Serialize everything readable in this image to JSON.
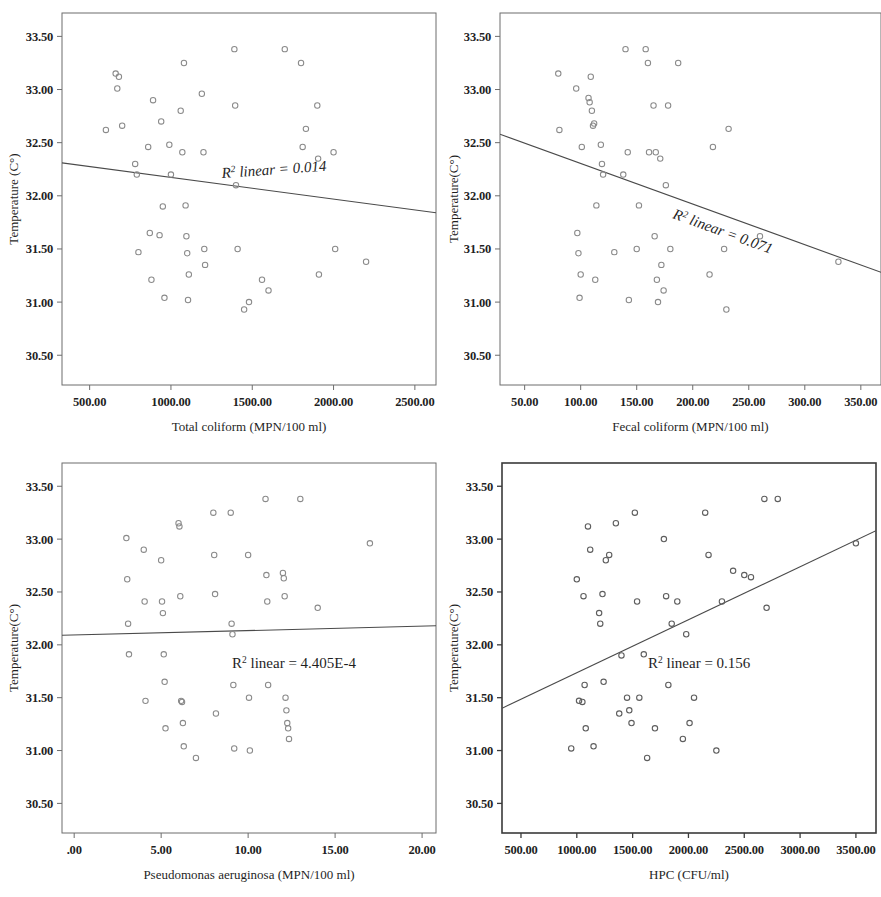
{
  "figure": {
    "panel_count": 4,
    "marker_shape": "open-circle",
    "line_color": "#4a4a4a",
    "marker_color": "#8a8a8a",
    "frame_color": "#6d6d6d"
  },
  "chart_data": [
    {
      "id": "panel-top-left",
      "type": "scatter",
      "title": "",
      "xlabel": "Total coliform (MPN/100 ml)",
      "ylabel": "Temperature (C°)",
      "annotation": "R² linear = 0.014",
      "annotation_prefix": "R",
      "annotation_sup": "2",
      "annotation_suffix": " linear = 0.014",
      "annotation_italic": true,
      "annotation_rotation": -4,
      "r_squared": 0.014,
      "xlim": [
        330,
        2630
      ],
      "ylim": [
        30.22,
        33.72
      ],
      "xticks": [
        500,
        1000,
        1500,
        2000,
        2500
      ],
      "xticklabels": [
        "500.00",
        "1000.00",
        "1500.00",
        "2000.00",
        "2500.00"
      ],
      "yticks": [
        30.5,
        31.0,
        31.5,
        32.0,
        32.5,
        33.0,
        33.5
      ],
      "yticklabels": [
        "30.50",
        "31.00",
        "31.50",
        "32.00",
        "32.50",
        "33.00",
        "33.50"
      ],
      "grid": false,
      "legend": "none",
      "fit_line": {
        "x0": 330,
        "y0": 32.31,
        "x1": 2630,
        "y1": 31.84
      },
      "points": [
        [
          600,
          32.62
        ],
        [
          660,
          33.15
        ],
        [
          680,
          33.12
        ],
        [
          670,
          33.01
        ],
        [
          700,
          32.66
        ],
        [
          780,
          32.3
        ],
        [
          790,
          32.2
        ],
        [
          800,
          31.47
        ],
        [
          860,
          32.46
        ],
        [
          870,
          31.65
        ],
        [
          880,
          31.21
        ],
        [
          890,
          32.9
        ],
        [
          930,
          31.63
        ],
        [
          940,
          32.7
        ],
        [
          950,
          31.9
        ],
        [
          960,
          31.04
        ],
        [
          990,
          32.48
        ],
        [
          1000,
          32.2
        ],
        [
          1060,
          32.8
        ],
        [
          1070,
          32.41
        ],
        [
          1080,
          33.25
        ],
        [
          1090,
          31.91
        ],
        [
          1095,
          31.62
        ],
        [
          1100,
          31.46
        ],
        [
          1105,
          31.02
        ],
        [
          1110,
          31.26
        ],
        [
          1190,
          32.96
        ],
        [
          1200,
          32.41
        ],
        [
          1205,
          31.5
        ],
        [
          1210,
          31.35
        ],
        [
          1390,
          33.38
        ],
        [
          1395,
          32.85
        ],
        [
          1400,
          32.1
        ],
        [
          1410,
          31.5
        ],
        [
          1450,
          30.93
        ],
        [
          1480,
          31.0
        ],
        [
          1560,
          31.21
        ],
        [
          1600,
          31.11
        ],
        [
          1700,
          33.38
        ],
        [
          1800,
          33.25
        ],
        [
          1810,
          32.46
        ],
        [
          1830,
          32.63
        ],
        [
          1900,
          32.85
        ],
        [
          1905,
          32.35
        ],
        [
          1910,
          31.26
        ],
        [
          2000,
          32.41
        ],
        [
          2010,
          31.5
        ],
        [
          2200,
          31.38
        ]
      ]
    },
    {
      "id": "panel-top-right",
      "type": "scatter",
      "title": "",
      "xlabel": "Fecal coliform (MPN/100 ml)",
      "ylabel": "Temperature(C°)",
      "annotation": "R² linear = 0.071",
      "annotation_prefix": "R",
      "annotation_sup": "2",
      "annotation_suffix": " linear = 0.071",
      "annotation_italic": true,
      "annotation_rotation": 20,
      "r_squared": 0.071,
      "xlim": [
        28,
        368
      ],
      "ylim": [
        30.22,
        33.72
      ],
      "xticks": [
        50,
        100,
        150,
        200,
        250,
        300,
        350
      ],
      "xticklabels": [
        "50.00",
        "100.00",
        "150.00",
        "200.00",
        "250.00",
        "300.00",
        "350.00"
      ],
      "yticks": [
        30.5,
        31.0,
        31.5,
        32.0,
        32.5,
        33.0,
        33.5
      ],
      "yticklabels": [
        "30.50",
        "31.00",
        "31.50",
        "32.00",
        "32.50",
        "33.00",
        "33.50"
      ],
      "grid": false,
      "legend": "none",
      "fit_line": {
        "x0": 28,
        "y0": 32.58,
        "x1": 368,
        "y1": 31.28
      },
      "points": [
        [
          80,
          33.15
        ],
        [
          81,
          32.62
        ],
        [
          96,
          33.01
        ],
        [
          97,
          31.65
        ],
        [
          98,
          31.46
        ],
        [
          99,
          31.04
        ],
        [
          100,
          31.26
        ],
        [
          101,
          32.46
        ],
        [
          107,
          32.92
        ],
        [
          108,
          32.88
        ],
        [
          109,
          33.12
        ],
        [
          110,
          32.8
        ],
        [
          111,
          32.66
        ],
        [
          112,
          32.68
        ],
        [
          113,
          31.21
        ],
        [
          114,
          31.91
        ],
        [
          118,
          32.48
        ],
        [
          119,
          32.3
        ],
        [
          120,
          32.2
        ],
        [
          130,
          31.47
        ],
        [
          138,
          32.2
        ],
        [
          140,
          33.38
        ],
        [
          142,
          32.41
        ],
        [
          143,
          31.02
        ],
        [
          150,
          31.5
        ],
        [
          152,
          31.91
        ],
        [
          158,
          33.38
        ],
        [
          160,
          33.25
        ],
        [
          161,
          32.41
        ],
        [
          165,
          32.85
        ],
        [
          166,
          31.62
        ],
        [
          167,
          32.41
        ],
        [
          168,
          31.21
        ],
        [
          169,
          31.0
        ],
        [
          171,
          32.35
        ],
        [
          172,
          31.35
        ],
        [
          174,
          31.11
        ],
        [
          176,
          32.1
        ],
        [
          178,
          32.85
        ],
        [
          180,
          31.5
        ],
        [
          187,
          33.25
        ],
        [
          215,
          31.26
        ],
        [
          218,
          32.46
        ],
        [
          228,
          31.5
        ],
        [
          230,
          30.93
        ],
        [
          232,
          32.63
        ],
        [
          260,
          31.62
        ],
        [
          330,
          31.38
        ]
      ]
    },
    {
      "id": "panel-bottom-left",
      "type": "scatter",
      "title": "",
      "xlabel": "Pseudomonas aeruginosa (MPN/100 ml)",
      "ylabel": "Temperature(C°)",
      "annotation": "R² linear = 4.405E-4",
      "annotation_prefix": "R",
      "annotation_sup": "2",
      "annotation_suffix": " linear = 4.405E-4",
      "annotation_italic": false,
      "annotation_rotation": 0,
      "r_squared": 0.0004405,
      "xlim": [
        -0.7,
        20.8
      ],
      "ylim": [
        30.22,
        33.72
      ],
      "xticks": [
        0,
        5,
        10,
        15,
        20
      ],
      "xticklabels": [
        ".00",
        "5.00",
        "10.00",
        "15.00",
        "20.00"
      ],
      "yticks": [
        30.5,
        31.0,
        31.5,
        32.0,
        32.5,
        33.0,
        33.5
      ],
      "yticklabels": [
        "30.50",
        "31.00",
        "31.50",
        "32.00",
        "32.50",
        "33.00",
        "33.50"
      ],
      "grid": false,
      "legend": "none",
      "fit_line": {
        "x0": -0.7,
        "y0": 32.09,
        "x1": 20.8,
        "y1": 32.18
      },
      "points": [
        [
          3,
          33.01
        ],
        [
          3.05,
          32.62
        ],
        [
          3.1,
          32.2
        ],
        [
          3.15,
          31.91
        ],
        [
          4,
          32.9
        ],
        [
          4.05,
          32.41
        ],
        [
          4.1,
          31.47
        ],
        [
          5,
          32.8
        ],
        [
          5.05,
          32.41
        ],
        [
          5.1,
          32.3
        ],
        [
          5.15,
          31.91
        ],
        [
          5.2,
          31.65
        ],
        [
          5.25,
          31.21
        ],
        [
          6,
          33.15
        ],
        [
          6.05,
          33.12
        ],
        [
          6.1,
          32.46
        ],
        [
          6.15,
          31.47
        ],
        [
          6.2,
          31.46
        ],
        [
          6.25,
          31.26
        ],
        [
          6.3,
          31.04
        ],
        [
          7,
          30.93
        ],
        [
          8,
          33.25
        ],
        [
          8.05,
          32.85
        ],
        [
          8.1,
          32.48
        ],
        [
          8.15,
          31.35
        ],
        [
          9,
          33.25
        ],
        [
          9.05,
          32.2
        ],
        [
          9.1,
          32.1
        ],
        [
          9.15,
          31.62
        ],
        [
          9.2,
          31.02
        ],
        [
          10,
          32.85
        ],
        [
          10.05,
          31.5
        ],
        [
          10.1,
          31.0
        ],
        [
          11,
          33.38
        ],
        [
          11.05,
          32.66
        ],
        [
          11.1,
          32.41
        ],
        [
          11.15,
          31.62
        ],
        [
          12,
          32.68
        ],
        [
          12.05,
          32.63
        ],
        [
          12.1,
          32.46
        ],
        [
          12.15,
          31.5
        ],
        [
          12.2,
          31.38
        ],
        [
          12.25,
          31.26
        ],
        [
          12.3,
          31.21
        ],
        [
          12.35,
          31.11
        ],
        [
          13,
          33.38
        ],
        [
          14,
          32.35
        ],
        [
          17,
          32.96
        ]
      ]
    },
    {
      "id": "panel-bottom-right",
      "type": "scatter",
      "title": "",
      "xlabel": "HPC (CFU/ml)",
      "ylabel": "Temperature(C°)",
      "annotation": "R² linear = 0.156",
      "annotation_prefix": "R",
      "annotation_sup": "2",
      "annotation_suffix": " linear = 0.156",
      "annotation_italic": false,
      "annotation_rotation": 0,
      "r_squared": 0.156,
      "xlim": [
        330,
        3680
      ],
      "ylim": [
        30.22,
        33.72
      ],
      "xticks": [
        500,
        1000,
        1500,
        2000,
        2500,
        3000,
        3500
      ],
      "xticklabels": [
        "500.00",
        "1000.00",
        "1500.00",
        "2000.00",
        "2500.00",
        "3000.00",
        "3500.00"
      ],
      "yticks": [
        30.5,
        31.0,
        31.5,
        32.0,
        32.5,
        33.0,
        33.5
      ],
      "yticklabels": [
        "30.50",
        "31.00",
        "31.50",
        "32.00",
        "32.50",
        "33.00",
        "33.50"
      ],
      "grid": false,
      "legend": "none",
      "fit_line": {
        "x0": 330,
        "y0": 31.4,
        "x1": 3680,
        "y1": 33.08
      },
      "points": [
        [
          950,
          31.02
        ],
        [
          1000,
          32.62
        ],
        [
          1020,
          31.47
        ],
        [
          1050,
          31.46
        ],
        [
          1060,
          32.46
        ],
        [
          1070,
          31.62
        ],
        [
          1080,
          31.21
        ],
        [
          1100,
          33.12
        ],
        [
          1120,
          32.9
        ],
        [
          1150,
          31.04
        ],
        [
          1200,
          32.3
        ],
        [
          1210,
          32.2
        ],
        [
          1230,
          32.48
        ],
        [
          1240,
          31.65
        ],
        [
          1260,
          32.8
        ],
        [
          1290,
          32.85
        ],
        [
          1350,
          33.15
        ],
        [
          1380,
          31.35
        ],
        [
          1400,
          31.9
        ],
        [
          1450,
          31.5
        ],
        [
          1470,
          31.38
        ],
        [
          1490,
          31.26
        ],
        [
          1520,
          33.25
        ],
        [
          1540,
          32.41
        ],
        [
          1560,
          31.5
        ],
        [
          1600,
          31.91
        ],
        [
          1630,
          30.93
        ],
        [
          1700,
          31.21
        ],
        [
          1780,
          33.0
        ],
        [
          1800,
          32.46
        ],
        [
          1820,
          31.62
        ],
        [
          1850,
          32.2
        ],
        [
          1900,
          32.41
        ],
        [
          1950,
          31.11
        ],
        [
          1980,
          32.1
        ],
        [
          2010,
          31.26
        ],
        [
          2050,
          31.5
        ],
        [
          2150,
          33.25
        ],
        [
          2180,
          32.85
        ],
        [
          2250,
          31.0
        ],
        [
          2300,
          32.41
        ],
        [
          2400,
          32.7
        ],
        [
          2500,
          32.66
        ],
        [
          2560,
          32.64
        ],
        [
          2680,
          33.38
        ],
        [
          2700,
          32.35
        ],
        [
          2800,
          33.38
        ],
        [
          3500,
          32.96
        ]
      ]
    }
  ]
}
